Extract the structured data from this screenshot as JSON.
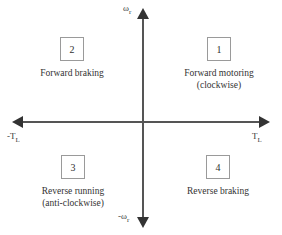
{
  "figure": {
    "type": "four-quadrant-operation-diagram",
    "axes": {
      "vertical_positive_label": "ω",
      "vertical_positive_sub": "r",
      "vertical_negative_label": "-ω",
      "vertical_negative_sub": "r",
      "horizontal_positive_label": "T",
      "horizontal_positive_sub": "L",
      "horizontal_negative_label": "-T",
      "horizontal_negative_sub": "L"
    },
    "quadrants": [
      {
        "number": "1",
        "position": "top-right",
        "line1": "Forward motoring",
        "line2": "(clockwise)"
      },
      {
        "number": "2",
        "position": "top-left",
        "line1": "Forward braking",
        "line2": ""
      },
      {
        "number": "3",
        "position": "bottom-left",
        "line1": "Reverse running",
        "line2": "(anti-clockwise)"
      },
      {
        "number": "4",
        "position": "bottom-right",
        "line1": "Reverse braking",
        "line2": ""
      }
    ],
    "colors": {
      "axis": "#555555",
      "arrow": "#333333",
      "box_border": "#9a9a9a",
      "text": "#333333",
      "background": "#ffffff"
    }
  }
}
